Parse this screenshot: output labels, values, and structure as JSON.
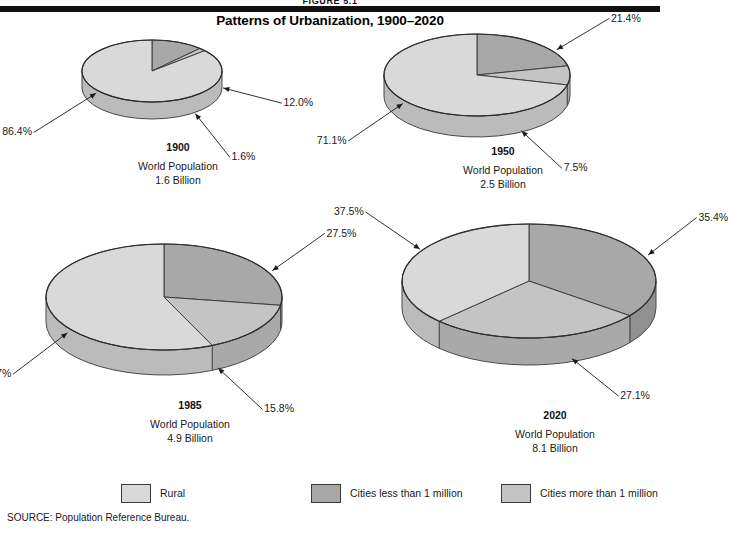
{
  "header": {
    "figure_label": "FIGURE 5.1",
    "title": "Patterns of Urbanization, 1900–2020",
    "rule_color": "#111111"
  },
  "legend": {
    "items": [
      {
        "label": "Rural",
        "color": "#d9d9d9",
        "key": "rural"
      },
      {
        "label": "Cities less than 1 million",
        "color": "#a8a8a8",
        "key": "cities_less"
      },
      {
        "label": "Cities more than 1 million",
        "color": "#c4c4c4",
        "key": "cities_more"
      }
    ]
  },
  "source": "SOURCE: Population Reference Bureau.",
  "chart_data": {
    "type": "pie",
    "title": "Patterns of Urbanization, 1900–2020",
    "legend_position": "bottom",
    "series_names": [
      "Rural",
      "Cities less than 1 million",
      "Cities more than 1 million"
    ],
    "series_colors": [
      "#d9d9d9",
      "#a8a8a8",
      "#c4c4c4"
    ],
    "units": "percent",
    "charts": [
      {
        "id": "pie-1900",
        "year": "1900",
        "caption_line1": "World Population",
        "caption_line2": "1.6 Billion",
        "population_billions": 1.6,
        "categories": [
          "Rural",
          "Cities less than 1 million",
          "Cities more than 1 million"
        ],
        "values": [
          86.4,
          12.0,
          1.6
        ],
        "labels": [
          "86.4%",
          "12.0%",
          "1.6%"
        ]
      },
      {
        "id": "pie-1950",
        "year": "1950",
        "caption_line1": "World Population",
        "caption_line2": "2.5 Billion",
        "population_billions": 2.5,
        "categories": [
          "Rural",
          "Cities less than 1 million",
          "Cities more than 1 million"
        ],
        "values": [
          71.1,
          21.4,
          7.5
        ],
        "labels": [
          "71.1%",
          "21.4%",
          "7.5%"
        ]
      },
      {
        "id": "pie-1985",
        "year": "1985",
        "caption_line1": "World Population",
        "caption_line2": "4.9 Billion",
        "population_billions": 4.9,
        "categories": [
          "Rural",
          "Cities less than 1 million",
          "Cities more than 1 million"
        ],
        "values": [
          56.7,
          27.5,
          15.8
        ],
        "labels": [
          "56.7%",
          "27.5%",
          "15.8%"
        ]
      },
      {
        "id": "pie-2020",
        "year": "2020",
        "caption_line1": "World Population",
        "caption_line2": "8.1 Billion",
        "population_billions": 8.1,
        "categories": [
          "Rural",
          "Cities less than 1 million",
          "Cities more than 1 million"
        ],
        "values": [
          37.5,
          35.4,
          27.1
        ],
        "labels": [
          "37.5%",
          "35.4%",
          "27.1%"
        ]
      }
    ]
  },
  "layout": {
    "panels": [
      {
        "chart_index": 0,
        "left": 48,
        "top": 28,
        "rx": 70,
        "ry": 31,
        "depth": 17,
        "cap_top": 112
      },
      {
        "chart_index": 1,
        "left": 350,
        "top": 22,
        "rx": 93,
        "ry": 41,
        "depth": 21,
        "cap_top": 122
      },
      {
        "chart_index": 2,
        "left": 12,
        "top": 232,
        "rx": 118,
        "ry": 53,
        "depth": 25,
        "cap_top": 166
      },
      {
        "chart_index": 3,
        "left": 368,
        "top": 212,
        "rx": 127,
        "ry": 57,
        "depth": 27,
        "cap_top": 196
      }
    ],
    "legend_positions": [
      121,
      311,
      501
    ]
  }
}
